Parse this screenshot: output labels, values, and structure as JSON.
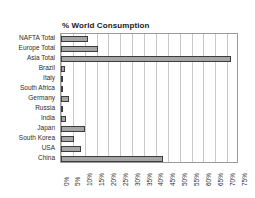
{
  "chart_data": {
    "type": "bar",
    "orientation": "horizontal",
    "title": "% World Consumption",
    "xlabel": "",
    "ylabel": "",
    "xlim": [
      0,
      75
    ],
    "grid": true,
    "legend": false,
    "xtick_labels": [
      "0%",
      "5%",
      "10%",
      "15%",
      "20%",
      "25%",
      "30%",
      "35%",
      "40%",
      "45%",
      "50%",
      "55%",
      "60%",
      "65%",
      "70%",
      "75%"
    ],
    "xtick_values": [
      0,
      5,
      10,
      15,
      20,
      25,
      30,
      35,
      40,
      45,
      50,
      55,
      60,
      65,
      70,
      75
    ],
    "categories": [
      "NAFTA Total",
      "Europe Total",
      "Asia Total",
      "Brazil",
      "Italy",
      "South Africa",
      "Germany",
      "Russia",
      "India",
      "Japan",
      "South Korea",
      "USA",
      "China"
    ],
    "values": [
      11.5,
      15.5,
      71.5,
      1.8,
      1.0,
      0.6,
      3.2,
      1.0,
      2.0,
      10.0,
      5.5,
      8.5,
      43.0
    ],
    "bar_fill_color": "#a6a6a6",
    "bar_edge_color": "#3c3c3c",
    "grid_color": "#c9c9c9",
    "frame_color": "#9a9a9a",
    "background_color": "#ffffff"
  }
}
